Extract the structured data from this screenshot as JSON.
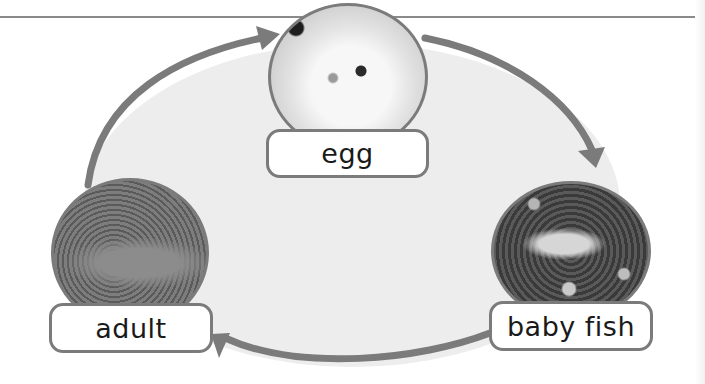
{
  "diagram": {
    "type": "life-cycle",
    "subject": "fish",
    "colors": {
      "arrow": "#7b7b7b",
      "fill": "#ededed",
      "rule": "#8a8a8a",
      "label_border": "#7b7b7b",
      "label_text": "#1a1a1a"
    },
    "stages": [
      {
        "id": "egg",
        "label": "egg",
        "image": "fish-egg-photo"
      },
      {
        "id": "baby-fish",
        "label": "baby fish",
        "image": "baby-fish-photo"
      },
      {
        "id": "adult",
        "label": "adult",
        "image": "adult-trout-photo"
      }
    ],
    "arrows": [
      {
        "from": "adult",
        "to": "egg"
      },
      {
        "from": "egg",
        "to": "baby fish"
      },
      {
        "from": "baby fish",
        "to": "adult"
      }
    ]
  }
}
